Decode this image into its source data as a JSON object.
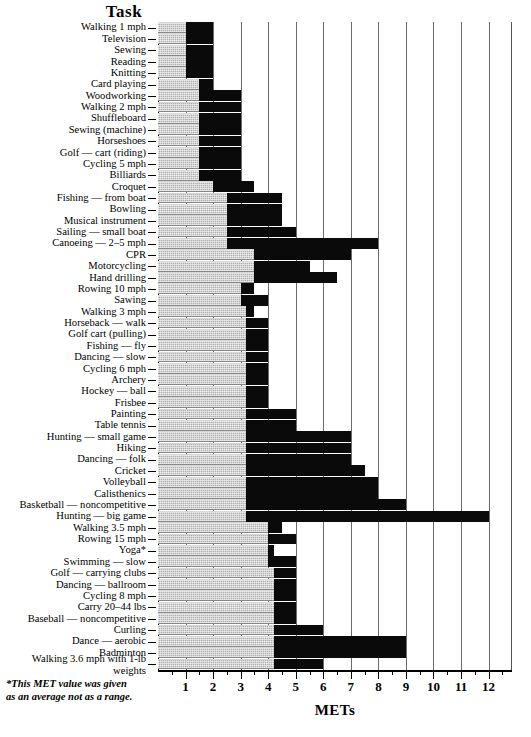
{
  "title": "Task",
  "footnote_line1": "*This MET value was given",
  "footnote_line2": "as an average not as a  range.",
  "xaxis_title": "METs",
  "colors": {
    "low_segment": "#b0b0b0",
    "high_segment": "#0a0a0a",
    "gridline": "#6b6b6b",
    "axis": "#000000",
    "background": "#ffffff"
  },
  "chart_data": {
    "type": "bar",
    "orientation": "horizontal",
    "subtype": "floating-range-bar",
    "title": "Task",
    "xlabel": "METs",
    "ylabel": "Task",
    "xlim": [
      0,
      12.85
    ],
    "ylim": null,
    "grid": "vertical-major-only",
    "legend": null,
    "annotations": [
      "*This MET value was given as an average not as a  range."
    ],
    "xticks": [
      1,
      2,
      3,
      4,
      5,
      6,
      7,
      8,
      9,
      10,
      11,
      12
    ],
    "xtick_labels": [
      "1",
      "2",
      "3",
      "4",
      "5",
      "6",
      "7",
      "8",
      "9",
      "10",
      "11",
      "12"
    ],
    "minor_tick_step": 0.5,
    "series": [
      {
        "name": "MET low (shaded)",
        "key": "low"
      },
      {
        "name": "MET range (solid)",
        "key": "high"
      }
    ],
    "categories": [
      "Walking 1 mph",
      "Television",
      "Sewing",
      "Reading",
      "Knitting",
      "Card playing",
      "Woodworking",
      "Walking 2 mph",
      "Shuffleboard",
      "Sewing (machine)",
      "Horseshoes",
      "Golf — cart (riding)",
      "Cycling 5 mph",
      "Billiards",
      "Croquet",
      "Fishing — from boat",
      "Bowling",
      "Musical instrument",
      "Sailing — small boat",
      "Canoeing — 2–5 mph",
      "CPR",
      "Motorcycling",
      "Hand drilling",
      "Rowing 10 mph",
      "Sawing",
      "Walking 3 mph",
      "Horseback — walk",
      "Golf cart (pulling)",
      "Fishing — fly",
      "Dancing — slow",
      "Cycling 6 mph",
      "Archery",
      "Hockey — ball",
      "Frisbee",
      "Painting",
      "Table tennis",
      "Hunting — small game",
      "Hiking",
      "Dancing — folk",
      "Cricket",
      "Volleyball",
      "Calisthenics",
      "Basketball — noncompetitive",
      "Hunting — big game",
      "Walking 3.5 mph",
      "Rowing 15 mph",
      "Yoga*",
      "Swimming — slow",
      "Golf — carrying clubs",
      "Dancing — ballroom",
      "Cycling 8 mph",
      "Carry 20–44 lbs",
      "Baseball — noncompetitive",
      "Curling",
      "Dance — aerobic",
      "Badminton",
      "Walking 3.6 mph with 1-lb weights"
    ],
    "ranges": [
      {
        "task": "Walking 1 mph",
        "low": 1.0,
        "high": 2.0
      },
      {
        "task": "Television",
        "low": 1.0,
        "high": 2.0
      },
      {
        "task": "Sewing",
        "low": 1.0,
        "high": 2.0
      },
      {
        "task": "Reading",
        "low": 1.0,
        "high": 2.0
      },
      {
        "task": "Knitting",
        "low": 1.0,
        "high": 2.0
      },
      {
        "task": "Card playing",
        "low": 1.5,
        "high": 2.0
      },
      {
        "task": "Woodworking",
        "low": 1.5,
        "high": 3.0
      },
      {
        "task": "Walking 2 mph",
        "low": 1.5,
        "high": 3.0
      },
      {
        "task": "Shuffleboard",
        "low": 1.5,
        "high": 3.0
      },
      {
        "task": "Sewing (machine)",
        "low": 1.5,
        "high": 3.0
      },
      {
        "task": "Horseshoes",
        "low": 1.5,
        "high": 3.0
      },
      {
        "task": "Golf — cart (riding)",
        "low": 1.5,
        "high": 3.0
      },
      {
        "task": "Cycling 5 mph",
        "low": 1.5,
        "high": 3.0
      },
      {
        "task": "Billiards",
        "low": 1.5,
        "high": 3.0
      },
      {
        "task": "Croquet",
        "low": 2.0,
        "high": 3.5
      },
      {
        "task": "Fishing — from boat",
        "low": 2.5,
        "high": 4.5
      },
      {
        "task": "Bowling",
        "low": 2.5,
        "high": 4.5
      },
      {
        "task": "Musical instrument",
        "low": 2.5,
        "high": 4.5
      },
      {
        "task": "Sailing — small boat",
        "low": 2.5,
        "high": 5.0
      },
      {
        "task": "Canoeing — 2–5 mph",
        "low": 2.5,
        "high": 8.0
      },
      {
        "task": "CPR",
        "low": 3.5,
        "high": 7.0
      },
      {
        "task": "Motorcycling",
        "low": 3.5,
        "high": 5.5
      },
      {
        "task": "Hand drilling",
        "low": 3.5,
        "high": 6.5
      },
      {
        "task": "Rowing 10 mph",
        "low": 3.0,
        "high": 3.5
      },
      {
        "task": "Sawing",
        "low": 3.0,
        "high": 4.0
      },
      {
        "task": "Walking 3 mph",
        "low": 3.2,
        "high": 3.5
      },
      {
        "task": "Horseback — walk",
        "low": 3.2,
        "high": 4.0
      },
      {
        "task": "Golf cart (pulling)",
        "low": 3.2,
        "high": 4.0
      },
      {
        "task": "Fishing — fly",
        "low": 3.2,
        "high": 4.0
      },
      {
        "task": "Dancing — slow",
        "low": 3.2,
        "high": 4.0
      },
      {
        "task": "Cycling 6 mph",
        "low": 3.2,
        "high": 4.0
      },
      {
        "task": "Archery",
        "low": 3.2,
        "high": 4.0
      },
      {
        "task": "Hockey — ball",
        "low": 3.2,
        "high": 4.0
      },
      {
        "task": "Frisbee",
        "low": 3.2,
        "high": 4.0
      },
      {
        "task": "Painting",
        "low": 3.2,
        "high": 5.0
      },
      {
        "task": "Table tennis",
        "low": 3.2,
        "high": 5.0
      },
      {
        "task": "Hunting — small game",
        "low": 3.2,
        "high": 7.0
      },
      {
        "task": "Hiking",
        "low": 3.2,
        "high": 7.0
      },
      {
        "task": "Dancing — folk",
        "low": 3.2,
        "high": 7.0
      },
      {
        "task": "Cricket",
        "low": 3.2,
        "high": 7.5
      },
      {
        "task": "Volleyball",
        "low": 3.2,
        "high": 8.0
      },
      {
        "task": "Calisthenics",
        "low": 3.2,
        "high": 8.0
      },
      {
        "task": "Basketball — noncompetitive",
        "low": 3.2,
        "high": 9.0
      },
      {
        "task": "Hunting — big game",
        "low": 3.2,
        "high": 12.0
      },
      {
        "task": "Walking 3.5 mph",
        "low": 4.0,
        "high": 4.5
      },
      {
        "task": "Rowing 15 mph",
        "low": 4.0,
        "high": 5.0
      },
      {
        "task": "Yoga*",
        "low": 4.0,
        "high": 4.2
      },
      {
        "task": "Swimming — slow",
        "low": 4.0,
        "high": 5.0
      },
      {
        "task": "Golf — carrying clubs",
        "low": 4.2,
        "high": 5.0
      },
      {
        "task": "Dancing — ballroom",
        "low": 4.2,
        "high": 5.0
      },
      {
        "task": "Cycling 8 mph",
        "low": 4.2,
        "high": 5.0
      },
      {
        "task": "Carry 20–44 lbs",
        "low": 4.2,
        "high": 5.0
      },
      {
        "task": "Baseball — noncompetitive",
        "low": 4.2,
        "high": 5.0
      },
      {
        "task": "Curling",
        "low": 4.2,
        "high": 6.0
      },
      {
        "task": "Dance — aerobic",
        "low": 4.2,
        "high": 9.0
      },
      {
        "task": "Badminton",
        "low": 4.2,
        "high": 9.0
      },
      {
        "task": "Walking 3.6 mph with 1-lb weights",
        "low": 4.2,
        "high": 6.0
      }
    ]
  }
}
